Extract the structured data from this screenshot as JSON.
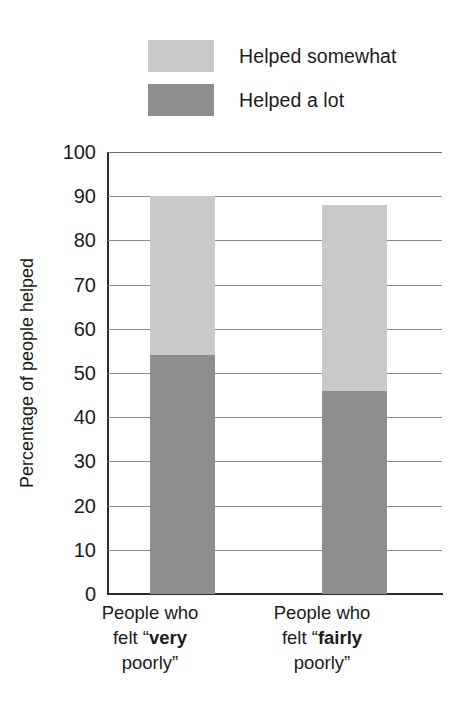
{
  "chart_data": {
    "type": "bar",
    "variant": "stacked",
    "title": "",
    "xlabel": "",
    "ylabel": "Percentage of people helped",
    "ylim": [
      0,
      100
    ],
    "ytick_step": 10,
    "yticks": [
      100,
      90,
      80,
      70,
      60,
      50,
      40,
      30,
      20,
      10,
      0
    ],
    "grid": true,
    "legend_position": "top",
    "categories": [
      "People who felt “very poorly”",
      "People who felt “fairly poorly”"
    ],
    "series": [
      {
        "name": "Helped somewhat",
        "color": "#c9c9c9",
        "values": [
          36,
          42
        ]
      },
      {
        "name": "Helped a lot",
        "color": "#8e8e8e",
        "values": [
          54,
          46
        ]
      }
    ],
    "stack_totals": [
      90,
      88
    ]
  },
  "legend": {
    "items": [
      {
        "label": "Helped somewhat",
        "color": "#c9c9c9"
      },
      {
        "label": "Helped a lot",
        "color": "#8e8e8e"
      }
    ]
  },
  "axis": {
    "y_title": "Percentage of people helped",
    "ticks": [
      "100",
      "90",
      "80",
      "70",
      "60",
      "50",
      "40",
      "30",
      "20",
      "10",
      "0"
    ]
  },
  "categories": [
    {
      "line1": "People who",
      "line2_pre": "felt “",
      "line2_bold": "very",
      "line3": "poorly”"
    },
    {
      "line1": "People who",
      "line2_pre": "felt “",
      "line2_bold": "fairly",
      "line3": "poorly”"
    }
  ],
  "colors": {
    "helped_somewhat": "#c9c9c9",
    "helped_a_lot": "#8e8e8e",
    "gridline": "#8c8c8c",
    "axis": "#2b2b2b",
    "text": "#1b1b1b",
    "background": "#ffffff"
  }
}
